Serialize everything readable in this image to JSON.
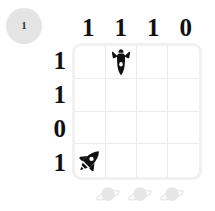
{
  "badge": {
    "label": "1",
    "color": "#e4e4e4"
  },
  "board": {
    "rows": 4,
    "columns": 4,
    "column_headers": [
      "1",
      "1",
      "1",
      "0"
    ],
    "row_headers": [
      "1",
      "1",
      "0",
      "1"
    ],
    "grid_line_color": "#ebebeb",
    "border_color": "#f1f1f1",
    "cells": [
      [
        {
          "icon": ""
        },
        {
          "icon": "shuttle-down-icon"
        },
        {
          "icon": ""
        },
        {
          "icon": ""
        }
      ],
      [
        {
          "icon": ""
        },
        {
          "icon": ""
        },
        {
          "icon": ""
        },
        {
          "icon": ""
        }
      ],
      [
        {
          "icon": ""
        },
        {
          "icon": ""
        },
        {
          "icon": ""
        },
        {
          "icon": ""
        }
      ],
      [
        {
          "icon": "rocket-diagonal-icon"
        },
        {
          "icon": ""
        },
        {
          "icon": ""
        },
        {
          "icon": ""
        }
      ]
    ],
    "sprite_color": "#111111"
  },
  "footer": {
    "planets": [
      "planet-icon",
      "planet-icon",
      "planet-icon"
    ],
    "planet_color": "#e6e6e6"
  }
}
